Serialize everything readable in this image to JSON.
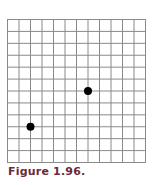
{
  "figure": {
    "caption": "Figure 1.96.",
    "caption_color": "#6b2a3a",
    "grid_line_color": "#8a8a8a",
    "point_color": "#000000"
  },
  "chart_data": {
    "type": "scatter",
    "title": "",
    "xlabel": "",
    "ylabel": "",
    "grid": true,
    "grid_columns": 12,
    "grid_rows": 12,
    "xlim": [
      0,
      12
    ],
    "ylim": [
      0,
      12
    ],
    "points": [
      {
        "x": 2,
        "y": 3
      },
      {
        "x": 7,
        "y": 6
      }
    ],
    "legend": null,
    "annotations": []
  }
}
